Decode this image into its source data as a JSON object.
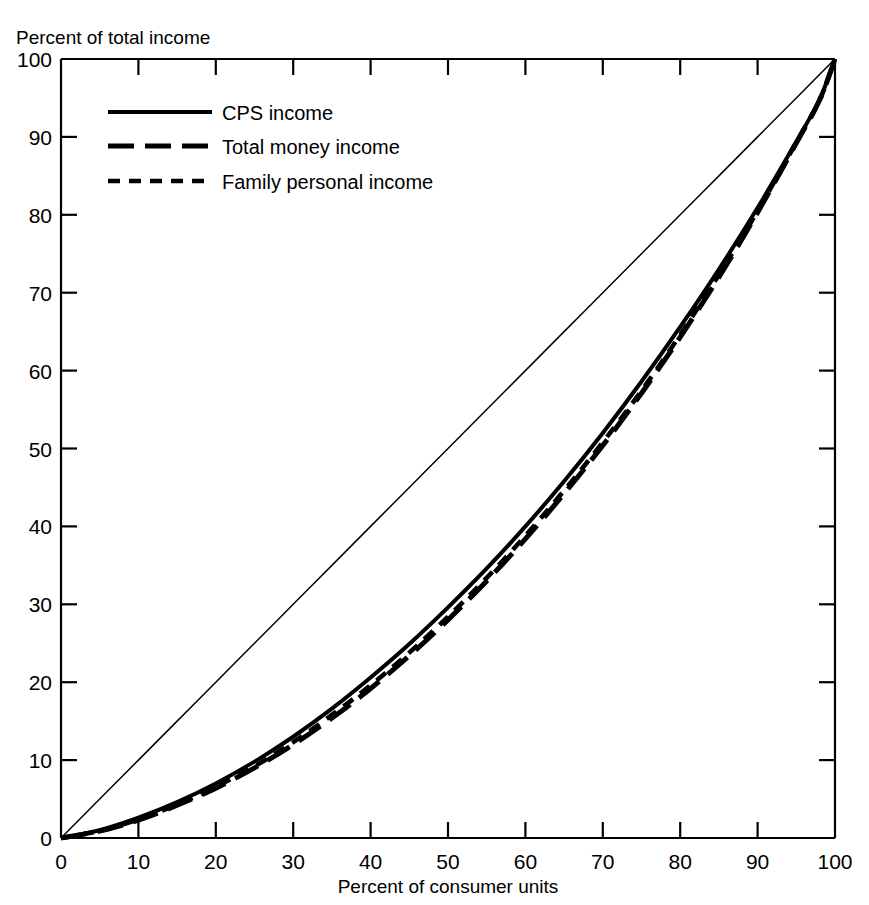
{
  "chart_data": {
    "type": "line",
    "title": "",
    "xlabel": "Percent of consumer units",
    "ylabel": "Percent of total income",
    "xlim": [
      0,
      100
    ],
    "ylim": [
      0,
      100
    ],
    "grid": false,
    "legend_position": "upper-left-inside",
    "xticks": [
      0,
      10,
      20,
      30,
      40,
      50,
      60,
      70,
      80,
      90,
      100
    ],
    "yticks": [
      0,
      10,
      20,
      30,
      40,
      50,
      60,
      70,
      80,
      90,
      100
    ],
    "xtick_labels": [
      "0",
      "10",
      "20",
      "30",
      "40",
      "50",
      "60",
      "70",
      "80",
      "90",
      "100"
    ],
    "ytick_labels": [
      "0",
      "10",
      "20",
      "30",
      "40",
      "50",
      "60",
      "70",
      "80",
      "90",
      "100"
    ],
    "x": [
      0,
      5,
      10,
      15,
      20,
      25,
      30,
      35,
      40,
      45,
      50,
      55,
      60,
      65,
      70,
      75,
      80,
      85,
      90,
      95,
      98,
      100
    ],
    "series": [
      {
        "name": "CPS income",
        "style": "solid",
        "values": [
          0,
          1.0,
          2.6,
          4.6,
          7.0,
          9.8,
          13.0,
          16.6,
          20.6,
          24.9,
          29.6,
          34.6,
          40.0,
          45.8,
          52.0,
          58.6,
          65.6,
          73.0,
          80.9,
          89.4,
          94.8,
          100
        ]
      },
      {
        "name": "Total money income",
        "style": "long-dash",
        "values": [
          0,
          0.9,
          2.3,
          4.2,
          6.4,
          9.0,
          12.0,
          15.4,
          19.2,
          23.4,
          28.0,
          33.0,
          38.4,
          44.2,
          50.4,
          57.1,
          64.3,
          72.0,
          80.3,
          89.2,
          94.7,
          100
        ]
      },
      {
        "name": "Family personal income",
        "style": "short-dash",
        "values": [
          0,
          0.9,
          2.4,
          4.3,
          6.6,
          9.2,
          12.3,
          15.8,
          19.6,
          23.8,
          28.4,
          33.4,
          38.8,
          44.6,
          50.8,
          57.4,
          64.6,
          72.3,
          80.5,
          89.3,
          94.7,
          100
        ]
      },
      {
        "name": "line of equality",
        "style": "thin-solid",
        "values": [
          0,
          5,
          10,
          15,
          20,
          25,
          30,
          35,
          40,
          45,
          50,
          55,
          60,
          65,
          70,
          75,
          80,
          85,
          90,
          95,
          98,
          100
        ]
      }
    ],
    "annotations": []
  },
  "legend": {
    "items": [
      {
        "label": "CPS income",
        "style": "solid"
      },
      {
        "label": "Total money income",
        "style": "long-dash"
      },
      {
        "label": "Family personal income",
        "style": "short-dash"
      }
    ]
  },
  "axes": {
    "y_title": "Percent of total income",
    "x_title": "Percent of consumer units",
    "y_labels": [
      "100",
      "90",
      "80",
      "70",
      "60",
      "50",
      "40",
      "30",
      "20",
      "10",
      "0"
    ],
    "x_labels": [
      "0",
      "10",
      "20",
      "30",
      "40",
      "50",
      "60",
      "70",
      "80",
      "90",
      "100"
    ]
  },
  "colors": {
    "ink": "#000000",
    "background": "#ffffff"
  }
}
